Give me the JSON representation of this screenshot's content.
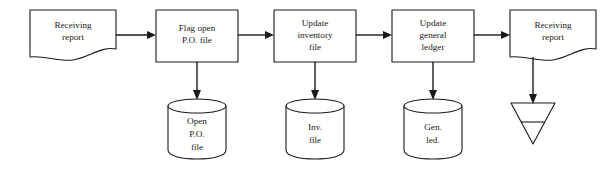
{
  "diagram": {
    "background_color": "#ffffff",
    "line_color": "#1a1a1a",
    "nodes": [
      {
        "id": "doc-receiving-report-in",
        "type": "document",
        "lines": [
          "Receiving",
          "report"
        ],
        "x": 30,
        "y": 10,
        "w": 86,
        "h": 46
      },
      {
        "id": "proc-flag-open-po",
        "type": "process",
        "lines": [
          "Flag open",
          "P.O. file"
        ],
        "x": 156,
        "y": 10,
        "w": 82,
        "h": 52
      },
      {
        "id": "proc-update-inventory",
        "type": "process",
        "lines": [
          "Update",
          "inventory",
          "file"
        ],
        "x": 274,
        "y": 10,
        "w": 82,
        "h": 52
      },
      {
        "id": "proc-update-general-ledger",
        "type": "process",
        "lines": [
          "Update",
          "general",
          "ledger"
        ],
        "x": 392,
        "y": 10,
        "w": 82,
        "h": 52
      },
      {
        "id": "doc-receiving-report-out",
        "type": "document",
        "lines": [
          "Receiving",
          "report"
        ],
        "x": 510,
        "y": 10,
        "w": 86,
        "h": 46
      }
    ],
    "data_stores": [
      {
        "id": "store-open-po-file",
        "type": "cylinder",
        "lines": [
          "Open",
          "P.O.",
          "file"
        ],
        "x": 168,
        "y": 99,
        "w": 58,
        "h": 58
      },
      {
        "id": "store-inv-file",
        "type": "cylinder",
        "lines": [
          "Inv.",
          "file"
        ],
        "x": 286,
        "y": 99,
        "w": 58,
        "h": 58
      },
      {
        "id": "store-gen-led",
        "type": "cylinder",
        "lines": [
          "Gen.",
          "led."
        ],
        "x": 404,
        "y": 99,
        "w": 58,
        "h": 58
      }
    ],
    "terminators": [
      {
        "id": "file-triangle",
        "type": "offline-storage-triangle",
        "label": "",
        "x": 511,
        "y": 103,
        "w": 44,
        "h": 41
      }
    ],
    "connectors": [
      {
        "id": "conn-doc-in-to-flag",
        "from": "doc-receiving-report-in",
        "to": "proc-flag-open-po",
        "direction": "right"
      },
      {
        "id": "conn-flag-to-inventory",
        "from": "proc-flag-open-po",
        "to": "proc-update-inventory",
        "direction": "right"
      },
      {
        "id": "conn-inventory-to-ledger",
        "from": "proc-update-inventory",
        "to": "proc-update-general-ledger",
        "direction": "right"
      },
      {
        "id": "conn-ledger-to-doc-out",
        "from": "proc-update-general-ledger",
        "to": "doc-receiving-report-out",
        "direction": "right"
      },
      {
        "id": "conn-flag-to-open-po-store",
        "from": "proc-flag-open-po",
        "to": "store-open-po-file",
        "direction": "down"
      },
      {
        "id": "conn-inventory-to-inv-store",
        "from": "proc-update-inventory",
        "to": "store-inv-file",
        "direction": "down"
      },
      {
        "id": "conn-ledger-to-gen-store",
        "from": "proc-update-general-ledger",
        "to": "store-gen-led",
        "direction": "down"
      },
      {
        "id": "conn-doc-out-to-triangle",
        "from": "doc-receiving-report-out",
        "to": "file-triangle",
        "direction": "down"
      }
    ]
  }
}
